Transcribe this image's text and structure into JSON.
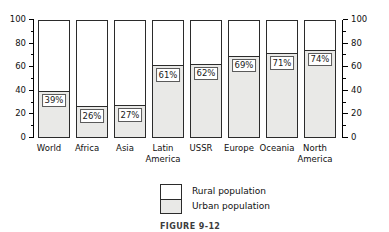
{
  "chart_data": {
    "type": "bar",
    "title": "",
    "subtitle": "",
    "xlabel": "",
    "ylabel": "",
    "ylim": [
      0,
      100
    ],
    "grid": false,
    "stacked": true,
    "legend_position": "bottom-center",
    "axis": {
      "left_ticks": [
        0,
        20,
        40,
        60,
        80,
        100
      ],
      "right_ticks": [
        0,
        20,
        40,
        60,
        80,
        100
      ],
      "minor_ticks": [
        10,
        30,
        50,
        70,
        90
      ],
      "left_tick_labels": [
        "0",
        "20",
        "40",
        "60",
        "80",
        "100"
      ],
      "right_tick_labels": [
        "0",
        "20",
        "40",
        "60",
        "80",
        "100"
      ]
    },
    "categories": [
      "World",
      "Africa",
      "Asia",
      "Latin\nAmerica",
      "USSR",
      "Europe",
      "Oceania",
      "North\nAmerica"
    ],
    "series": [
      {
        "name": "Urban population",
        "color": "#e9e9e7",
        "values": [
          39,
          26,
          27,
          61,
          62,
          69,
          71,
          74
        ],
        "labels": [
          "39%",
          "26%",
          "27%",
          "61%",
          "62%",
          "69%",
          "71%",
          "74%"
        ]
      },
      {
        "name": "Rural population",
        "color": "#ffffff",
        "values": [
          61,
          74,
          73,
          39,
          38,
          31,
          29,
          26
        ],
        "labels": [
          "",
          "",
          "",
          "",
          "",
          "",
          "",
          ""
        ]
      }
    ],
    "legend": [
      {
        "label": "Rural population",
        "swatch": "#ffffff"
      },
      {
        "label": "Urban population",
        "swatch": "#e9e9e7"
      }
    ],
    "caption": "FIGURE 9-12"
  },
  "colors": {
    "urban_fill": "#e9e9e7",
    "rural_fill": "#ffffff",
    "outline": "#2b2b2b",
    "text": "#111111"
  }
}
